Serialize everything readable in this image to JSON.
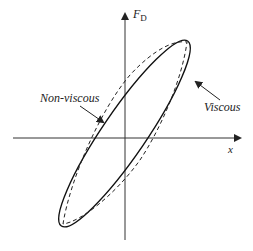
{
  "diagram": {
    "axes": {
      "x_label": "x",
      "y_label_main": "F",
      "y_label_sub": "D"
    },
    "curves": [
      {
        "name": "Viscous",
        "style": "solid"
      },
      {
        "name": "Non-viscous",
        "style": "dashed"
      }
    ],
    "annotations": {
      "non_viscous": "Non-viscous",
      "viscous": "Viscous"
    },
    "colors": {
      "line": "#222222",
      "background": "#ffffff"
    }
  }
}
